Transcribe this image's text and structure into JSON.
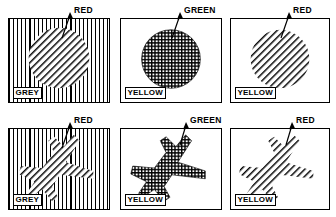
{
  "figure": {
    "type": "texture-segregation-stimulus-array",
    "rows": 2,
    "columns": 3,
    "panel_count": 6
  },
  "panels": [
    {
      "id": "panel-top-left",
      "row": 1,
      "column": 1,
      "background_label": "GREY",
      "callout_label": "RED",
      "background_texture": "vertical-lines",
      "figure_texture": "diagonal-lines",
      "figure_shape": "circle"
    },
    {
      "id": "panel-top-center",
      "row": 1,
      "column": 2,
      "background_label": "YELLOW",
      "callout_label": "GREEN",
      "background_texture": "plain",
      "figure_texture": "cross-hatch",
      "figure_shape": "circle"
    },
    {
      "id": "panel-top-right",
      "row": 1,
      "column": 3,
      "background_label": "YELLOW",
      "callout_label": "RED",
      "background_texture": "plain",
      "figure_texture": "diagonal-lines",
      "figure_shape": "circle"
    },
    {
      "id": "panel-bottom-left",
      "row": 2,
      "column": 1,
      "background_label": "GREY",
      "callout_label": "RED",
      "background_texture": "vertical-lines",
      "figure_texture": "diagonal-lines",
      "figure_shape": "airplane"
    },
    {
      "id": "panel-bottom-center",
      "row": 2,
      "column": 2,
      "background_label": "YELLOW",
      "callout_label": "GREEN",
      "background_texture": "plain",
      "figure_texture": "cross-hatch",
      "figure_shape": "airplane"
    },
    {
      "id": "panel-bottom-right",
      "row": 2,
      "column": 3,
      "background_label": "YELLOW",
      "callout_label": "RED",
      "background_texture": "plain",
      "figure_texture": "diagonal-lines",
      "figure_shape": "airplane"
    }
  ],
  "colors": {
    "ink": "#000000",
    "paper": "#ffffff"
  }
}
